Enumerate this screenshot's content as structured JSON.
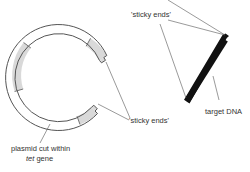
{
  "diagram": {
    "title": "",
    "colors": {
      "outline": "#555555",
      "shading": "#d9d9d9",
      "dna": "#111111",
      "leader": "#555555",
      "text": "#333333"
    },
    "labels": {
      "sticky_ends_top": "'sticky ends'",
      "sticky_ends_bottom": "'sticky ends'",
      "target_dna": "target DNA",
      "plasmid_line1": "plasmid cut within",
      "plasmid_line2_italic": "tet",
      "plasmid_line2_rest": " gene"
    },
    "components": [
      {
        "name": "plasmid",
        "description": "circular plasmid opened by restriction cut within tet gene; shaded segments mark gene regions"
      },
      {
        "name": "target-dna",
        "description": "linear double-stranded target DNA fragment with staggered sticky ends"
      }
    ]
  }
}
